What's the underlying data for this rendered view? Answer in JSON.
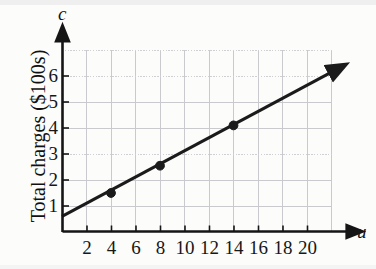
{
  "chart_data": {
    "type": "line",
    "title": "",
    "subtitle": "",
    "xlabel": "u",
    "ylabel": "Total charges ($100s)",
    "x_axis_variable": "u",
    "y_axis_variable": "c",
    "xlim": [
      0,
      22
    ],
    "ylim": [
      0,
      7
    ],
    "xticks": [
      2,
      4,
      6,
      8,
      10,
      12,
      14,
      16,
      18,
      20
    ],
    "yticks": [
      1,
      2,
      3,
      4,
      5,
      6
    ],
    "xtick_labels": [
      "2",
      "4",
      "6",
      "8",
      "10",
      "12",
      "14",
      "16",
      "18",
      "20"
    ],
    "ytick_labels": [
      "1",
      "2",
      "3",
      "4",
      "5",
      "6"
    ],
    "grid": true,
    "grid_color": "#c9c9ce",
    "legend": false,
    "legend_position": "none",
    "line_color": "#1b1b1b",
    "marker_color": "#1b1b1b",
    "series": [
      {
        "name": "Total charges",
        "marked_points": [
          {
            "x": 4,
            "y": 1.5
          },
          {
            "x": 8,
            "y": 2.55
          },
          {
            "x": 14,
            "y": 4.1
          }
        ],
        "line_endpoints": [
          {
            "x": 0,
            "y": 0.6
          },
          {
            "x": 22,
            "y": 6.15
          }
        ],
        "intercept": 0.6,
        "slope": 0.25
      }
    ],
    "annotations": [
      {
        "text": "c",
        "role": "y-axis-variable",
        "italic": true
      },
      {
        "text": "u",
        "role": "x-axis-variable",
        "italic": true
      }
    ]
  },
  "axis": {
    "y_variable": "c",
    "x_variable": "u",
    "y_title": "Total charges ($100s)"
  }
}
